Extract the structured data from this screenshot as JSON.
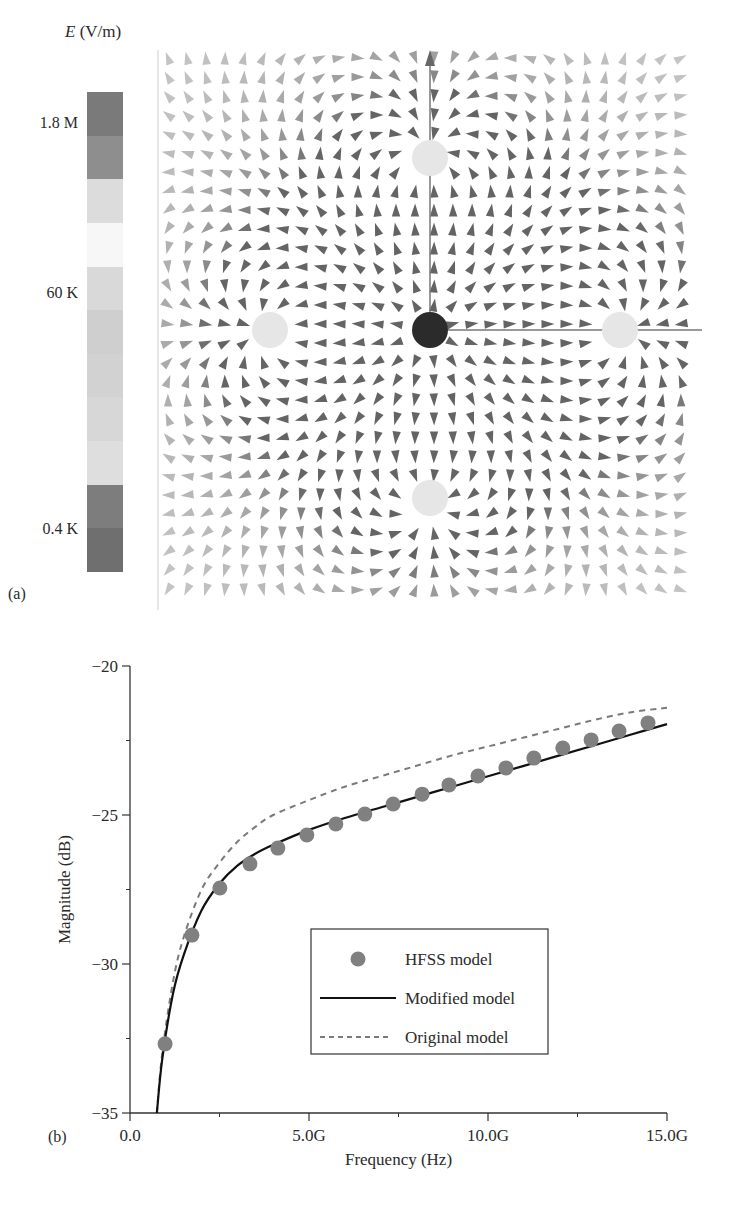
{
  "panel_a": {
    "label": "(a)",
    "colorbar": {
      "title_symbol": "E",
      "title_unit": " (V/m)",
      "tick_labels": [
        {
          "text": "1.8 M",
          "y": 124
        },
        {
          "text": "60 K",
          "y": 294
        },
        {
          "text": "0.4 K",
          "y": 530
        }
      ],
      "bands": [
        "#7a7a7a",
        "#8e8e8e",
        "#dcdcdc",
        "#f7f7f7",
        "#d9d9d9",
        "#cfcfcf",
        "#d2d2d2",
        "#d7d7d7",
        "#dedede",
        "#7d7d7d",
        "#6f6f6f"
      ]
    },
    "field_plot": {
      "description": "E-field vector plot around a central conductor with four surrounding return conductors",
      "conductors": [
        {
          "name": "center",
          "type": "signal",
          "color": "#2b2b2b"
        },
        {
          "name": "top",
          "type": "return",
          "color": "#e6e6e6"
        },
        {
          "name": "bottom",
          "type": "return",
          "color": "#e6e6e6"
        },
        {
          "name": "left",
          "type": "return",
          "color": "#e6e6e6"
        },
        {
          "name": "right",
          "type": "return",
          "color": "#e6e6e6"
        }
      ]
    }
  },
  "panel_b": {
    "label": "(b)"
  },
  "chart_data": {
    "type": "line",
    "title": "",
    "xlabel": "Frequency (Hz)",
    "ylabel": "Magnitude (dB)",
    "xlim": [
      0,
      15
    ],
    "ylim": [
      -35,
      -20
    ],
    "x_unit": "GHz",
    "xticks": [
      0,
      5,
      10,
      15
    ],
    "xtick_labels": [
      "0.0",
      "5.0G",
      "10.0G",
      "15.0G"
    ],
    "x_minor_ticks": [
      2.5,
      7.5,
      12.5
    ],
    "yticks": [
      -20,
      -25,
      -30,
      -35
    ],
    "ytick_labels": [
      "−20",
      "−25",
      "−30",
      "−35"
    ],
    "y_minor_ticks": [
      -22.5,
      -27.5,
      -32.5
    ],
    "grid": false,
    "legend_position": "center-right inside plot",
    "series": [
      {
        "name": "HFSS model",
        "style": "markers",
        "color": "#808080",
        "x": [
          0.98,
          1.73,
          2.51,
          3.35,
          4.13,
          4.94,
          5.75,
          6.56,
          7.35,
          8.16,
          8.91,
          9.72,
          10.5,
          11.28,
          12.09,
          12.88,
          13.66,
          14.47
        ],
        "y": [
          -32.68,
          -29.03,
          -27.45,
          -26.64,
          -26.11,
          -25.67,
          -25.3,
          -24.97,
          -24.63,
          -24.3,
          -23.99,
          -23.69,
          -23.42,
          -23.09,
          -22.75,
          -22.48,
          -22.18,
          -21.91
        ]
      },
      {
        "name": "Modified model",
        "style": "solid",
        "color": "#111111",
        "x": [
          0.75,
          0.9,
          1.2,
          1.5,
          2.0,
          2.5,
          3.0,
          3.5,
          4.0,
          5.0,
          6.0,
          7.0,
          8.0,
          9.0,
          10.0,
          11.0,
          12.0,
          13.0,
          14.0,
          15.0
        ],
        "y": [
          -35.0,
          -33.2,
          -31.0,
          -29.7,
          -28.2,
          -27.3,
          -26.7,
          -26.3,
          -26.0,
          -25.5,
          -25.1,
          -24.75,
          -24.4,
          -24.05,
          -23.7,
          -23.35,
          -23.0,
          -22.65,
          -22.3,
          -21.95
        ]
      },
      {
        "name": "Original model",
        "style": "dashed",
        "color": "#7a7a7a",
        "x": [
          0.75,
          0.9,
          1.2,
          1.5,
          2.0,
          2.5,
          3.0,
          3.5,
          4.0,
          5.0,
          6.0,
          7.0,
          8.0,
          9.0,
          10.0,
          11.0,
          12.0,
          13.0,
          14.0,
          15.0
        ],
        "y": [
          -35.0,
          -33.0,
          -30.6,
          -29.1,
          -27.5,
          -26.6,
          -25.9,
          -25.4,
          -25.0,
          -24.5,
          -24.05,
          -23.7,
          -23.35,
          -23.0,
          -22.7,
          -22.4,
          -22.1,
          -21.8,
          -21.55,
          -21.4
        ]
      }
    ]
  },
  "caption": "(a) Distribution of E-field ... (b) Coupling ... comparison"
}
